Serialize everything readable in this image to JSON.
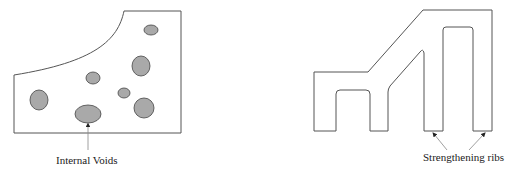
{
  "figures": [
    {
      "name": "casting-with-voids",
      "label": "Internal Voids",
      "voids": [
        {
          "cx": 151,
          "cy": 30,
          "rx": 7,
          "ry": 5
        },
        {
          "cx": 141,
          "cy": 66,
          "rx": 9,
          "ry": 10
        },
        {
          "cx": 93,
          "cy": 78,
          "rx": 7,
          "ry": 6
        },
        {
          "cx": 39,
          "cy": 100,
          "rx": 9,
          "ry": 10
        },
        {
          "cx": 124,
          "cy": 93,
          "rx": 6,
          "ry": 5
        },
        {
          "cx": 144,
          "cy": 108,
          "rx": 10,
          "ry": 10
        },
        {
          "cx": 88,
          "cy": 114,
          "rx": 13,
          "ry": 9
        }
      ]
    },
    {
      "name": "ribbed-casting",
      "label": "Strengthening ribs"
    }
  ],
  "colors": {
    "outline": "#555555",
    "void_fill": "#a9a9a9",
    "void_stroke": "#444444",
    "arrow": "#888888"
  }
}
